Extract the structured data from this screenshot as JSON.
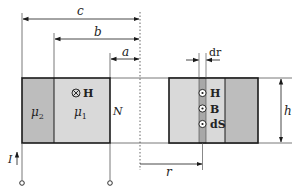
{
  "diagram": {
    "type": "toroidal-coil-cross-section",
    "colors": {
      "line": "#1a1a1a",
      "thin_line": "#555555",
      "mu2_fill": "#bdbdbd",
      "mu1_fill": "#d9d9d9",
      "strip_fill": "#a8a8a8",
      "axis": "#666666"
    },
    "dimensions": {
      "c": "c",
      "b": "b",
      "a": "a",
      "h": "h",
      "r": "r",
      "dr": "dr"
    },
    "left_section": {
      "outer_material": "μ",
      "outer_material_sub": "2",
      "inner_material": "μ",
      "inner_material_sub": "1",
      "field_symbol": "⊗",
      "field_label": "H",
      "turns_label": "N"
    },
    "right_section": {
      "vectors": [
        {
          "symbol": "⊙",
          "label": "H"
        },
        {
          "symbol": "⊙",
          "label": "B"
        },
        {
          "symbol": "⊙",
          "label": "dS"
        }
      ]
    },
    "current": {
      "label": "I",
      "direction": "up"
    }
  }
}
